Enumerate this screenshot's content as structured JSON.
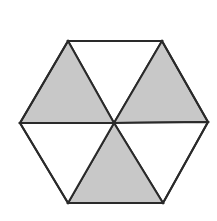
{
  "figure": {
    "shape_name": "regular-hexagon",
    "orientation": "flat-top",
    "background_color": "#ffffff",
    "stroke_color": "#2a2a2a",
    "stroke_width": 2,
    "shaded_fill": "#c8c8c8",
    "unshaded_fill": "#ffffff",
    "total_sectors": 6,
    "shaded_sectors": 3,
    "unshaded_sectors": 3,
    "shaded_fraction": "3/6",
    "center": {
      "x": 114,
      "y": 123
    },
    "vertices": [
      {
        "name": "top-left",
        "x": 68,
        "y": 41
      },
      {
        "name": "top-right",
        "x": 162,
        "y": 41
      },
      {
        "name": "right",
        "x": 208,
        "y": 122
      },
      {
        "name": "bottom-right",
        "x": 163,
        "y": 203
      },
      {
        "name": "bottom-left",
        "x": 68,
        "y": 203
      },
      {
        "name": "left",
        "x": 20,
        "y": 123
      }
    ],
    "sectors": [
      {
        "id": "sector-top",
        "label": "top",
        "shaded": false,
        "fill": "#ffffff",
        "points": "68,41 162,41 114,123"
      },
      {
        "id": "sector-upper-right",
        "label": "upper-right",
        "shaded": true,
        "fill": "#c8c8c8",
        "points": "162,41 208,122 114,123"
      },
      {
        "id": "sector-lower-right",
        "label": "lower-right",
        "shaded": false,
        "fill": "#ffffff",
        "points": "208,122 163,203 114,123"
      },
      {
        "id": "sector-bottom",
        "label": "bottom",
        "shaded": true,
        "fill": "#c8c8c8",
        "points": "163,203 68,203 114,123"
      },
      {
        "id": "sector-lower-left",
        "label": "lower-left",
        "shaded": false,
        "fill": "#ffffff",
        "points": "68,203 20,123 114,123"
      },
      {
        "id": "sector-upper-left",
        "label": "upper-left",
        "shaded": true,
        "fill": "#c8c8c8",
        "points": "20,123 68,41 114,123"
      }
    ],
    "outline_points": "68,41 162,41 208,122 163,203 68,203 20,123"
  }
}
